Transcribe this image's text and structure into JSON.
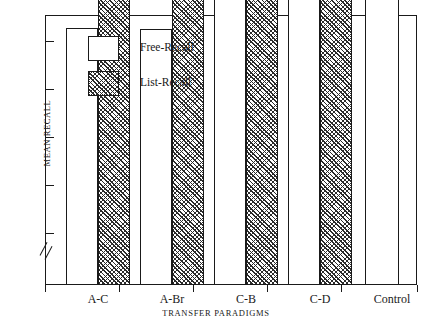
{
  "chart_data": {
    "type": "bar",
    "title": "",
    "xlabel": "TRANSFER PARADIGMS",
    "ylabel": "MEAN RECALL",
    "categories": [
      "A-C",
      "A-Br",
      "C-B",
      "C-D",
      "Control"
    ],
    "series": [
      {
        "name": "Free-Recall",
        "values": [
          4.81,
          4.79,
          6.4,
          6.52,
          7.72
        ],
        "fill": "white",
        "edge": "#1a1a1a"
      },
      {
        "name": "List-Recall",
        "values": [
          6.4,
          5.56,
          6.9,
          7.85,
          null
        ],
        "fill": "diagonal-hatch",
        "edge": "#1a1a1a"
      }
    ],
    "yticks": [
      4,
      5,
      6,
      7,
      8
    ],
    "ytick_labels": [
      "4",
      "5",
      "6",
      "7",
      "8"
    ],
    "ylim": [
      3.4,
      8.45
    ],
    "axis_break": true,
    "axis_break_note": "broken y-axis below 4",
    "grid": false,
    "legend_position": "upper-left-inside",
    "legend_entries": [
      "Free-Recall",
      "List-Recall"
    ]
  },
  "axes": {
    "y_title": "MEAN RECALL",
    "x_title": "TRANSFER PARADIGMS"
  },
  "legend": {
    "entries": [
      {
        "label": "Free-Recall",
        "swatch": "white-square-icon"
      },
      {
        "label": "List-Recall",
        "swatch": "hatched-square-icon"
      }
    ]
  }
}
